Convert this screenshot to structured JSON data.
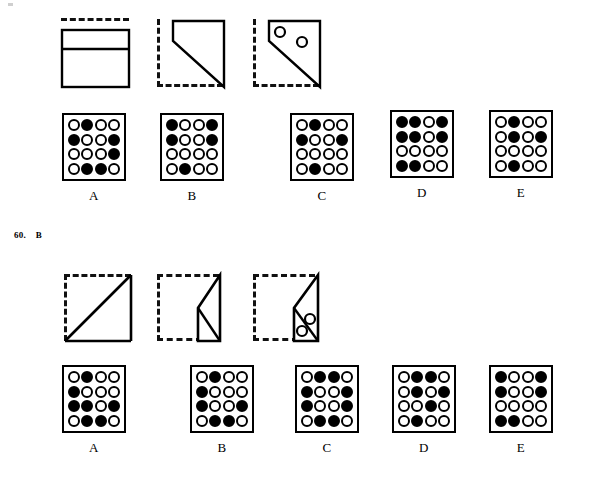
{
  "page": {
    "background_color": "#ffffff",
    "ink_color": "#000000",
    "width": 607,
    "height": 480
  },
  "questions": [
    {
      "id": "question-partial-top",
      "number": "",
      "answer": "",
      "label_visible": false,
      "stimulus": {
        "label": "folded-paper-sequence",
        "panels": [
          {
            "name": "panel-1",
            "kind": "rectangle-divided",
            "dashed_edges": [
              "top"
            ],
            "description": "solid rectangle with one horizontal divider line, dashed line above"
          },
          {
            "name": "panel-2",
            "kind": "fold-diagonal",
            "dashed_edges": [
              "left",
              "bottom"
            ],
            "description": "solid quadrilateral folded over with diagonal edge"
          },
          {
            "name": "panel-3",
            "kind": "fold-diagonal-punched",
            "dashed_edges": [
              "left",
              "bottom"
            ],
            "holes": 2,
            "description": "same folded shape with two punched holes"
          }
        ]
      },
      "options": [
        {
          "letter": "A",
          "name": "option-a",
          "grid": [
            [
              "open",
              "filled",
              "open",
              "open"
            ],
            [
              "filled",
              "open",
              "open",
              "filled"
            ],
            [
              "open",
              "open",
              "open",
              "filled"
            ],
            [
              "open",
              "filled",
              "filled",
              "open"
            ]
          ]
        },
        {
          "letter": "B",
          "name": "option-b",
          "grid": [
            [
              "filled",
              "open",
              "open",
              "filled"
            ],
            [
              "filled",
              "open",
              "open",
              "filled"
            ],
            [
              "open",
              "open",
              "open",
              "open"
            ],
            [
              "open",
              "filled",
              "open",
              "open"
            ]
          ]
        },
        {
          "letter": "C",
          "name": "option-c",
          "grid": [
            [
              "open",
              "filled",
              "open",
              "open"
            ],
            [
              "filled",
              "open",
              "open",
              "filled"
            ],
            [
              "open",
              "open",
              "open",
              "open"
            ],
            [
              "open",
              "filled",
              "open",
              "open"
            ]
          ]
        },
        {
          "letter": "D",
          "name": "option-d",
          "grid": [
            [
              "filled",
              "filled",
              "open",
              "filled"
            ],
            [
              "filled",
              "filled",
              "open",
              "filled"
            ],
            [
              "open",
              "open",
              "open",
              "open"
            ],
            [
              "filled",
              "filled",
              "open",
              "open"
            ]
          ]
        },
        {
          "letter": "E",
          "name": "option-e",
          "grid": [
            [
              "open",
              "filled",
              "open",
              "open"
            ],
            [
              "open",
              "filled",
              "open",
              "filled"
            ],
            [
              "open",
              "open",
              "open",
              "open"
            ],
            [
              "open",
              "filled",
              "open",
              "open"
            ]
          ]
        }
      ]
    },
    {
      "id": "question-60",
      "number": "60.",
      "answer": "B",
      "label_visible": true,
      "stimulus": {
        "label": "folded-paper-sequence",
        "panels": [
          {
            "name": "panel-1",
            "kind": "square-diagonal",
            "dashed_edges": [
              "top",
              "left"
            ],
            "description": "square with solid bottom, right and diagonal from bottom-left to top-right"
          },
          {
            "name": "panel-2",
            "kind": "fold-triangle",
            "dashed_edges": [
              "top",
              "left",
              "bottom"
            ],
            "description": "dashed square with solid folded triangle on the right side"
          },
          {
            "name": "panel-3",
            "kind": "fold-triangle-punched",
            "dashed_edges": [
              "top",
              "left",
              "bottom"
            ],
            "holes": 2,
            "description": "same folded triangle with two punched holes"
          }
        ]
      },
      "options": [
        {
          "letter": "A",
          "name": "option-a",
          "grid": [
            [
              "open",
              "filled",
              "open",
              "open"
            ],
            [
              "filled",
              "open",
              "open",
              "open"
            ],
            [
              "filled",
              "filled",
              "open",
              "filled"
            ],
            [
              "open",
              "filled",
              "filled",
              "open"
            ]
          ]
        },
        {
          "letter": "B",
          "name": "option-b",
          "grid": [
            [
              "open",
              "filled",
              "open",
              "open"
            ],
            [
              "filled",
              "open",
              "open",
              "open"
            ],
            [
              "filled",
              "open",
              "open",
              "filled"
            ],
            [
              "open",
              "filled",
              "filled",
              "open"
            ]
          ]
        },
        {
          "letter": "C",
          "name": "option-c",
          "grid": [
            [
              "open",
              "filled",
              "filled",
              "open"
            ],
            [
              "filled",
              "open",
              "open",
              "filled"
            ],
            [
              "filled",
              "open",
              "open",
              "filled"
            ],
            [
              "open",
              "filled",
              "filled",
              "open"
            ]
          ]
        },
        {
          "letter": "D",
          "name": "option-d",
          "grid": [
            [
              "open",
              "filled",
              "filled",
              "open"
            ],
            [
              "open",
              "filled",
              "open",
              "filled"
            ],
            [
              "open",
              "open",
              "filled",
              "open"
            ],
            [
              "open",
              "filled",
              "open",
              "open"
            ]
          ]
        },
        {
          "letter": "E",
          "name": "option-e",
          "grid": [
            [
              "filled",
              "open",
              "open",
              "filled"
            ],
            [
              "filled",
              "open",
              "open",
              "filled"
            ],
            [
              "open",
              "open",
              "open",
              "open"
            ],
            [
              "filled",
              "filled",
              "open",
              "open"
            ]
          ]
        }
      ]
    }
  ]
}
